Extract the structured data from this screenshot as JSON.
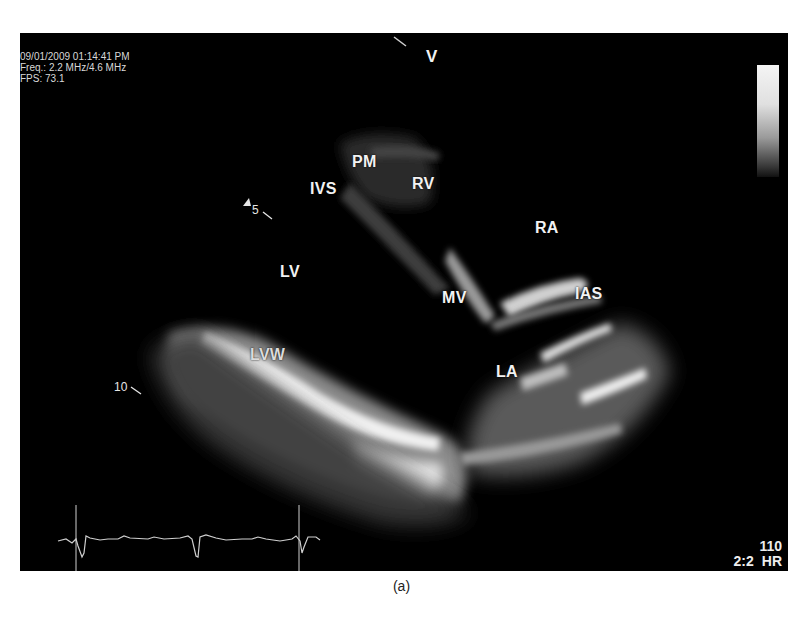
{
  "figure": {
    "caption": "(a)",
    "type": "echocardiogram-parasternal-long-axis"
  },
  "overlay": {
    "datetime": "09/01/2009 01:14:41 PM",
    "frequency": "Freq.: 2.2 MHz/4.6 MHz",
    "fps": "FPS: 73.1",
    "orientation_marker": "V",
    "heart_rate_value": "110",
    "heart_rate_ratio": "2:2",
    "heart_rate_label": "HR"
  },
  "depth_markers": [
    {
      "label": "5"
    },
    {
      "label": "10"
    }
  ],
  "anatomy_labels": [
    {
      "id": "pm",
      "text": "PM"
    },
    {
      "id": "rv",
      "text": "RV"
    },
    {
      "id": "ivs",
      "text": "IVS"
    },
    {
      "id": "ra",
      "text": "RA"
    },
    {
      "id": "lv",
      "text": "LV"
    },
    {
      "id": "mv",
      "text": "MV"
    },
    {
      "id": "ias",
      "text": "IAS"
    },
    {
      "id": "lvw",
      "text": "LVW"
    },
    {
      "id": "la",
      "text": "LA"
    }
  ],
  "colors": {
    "background": "#000000",
    "label": "#f2f2f2",
    "ecg_trace": "#cfcfcf"
  }
}
